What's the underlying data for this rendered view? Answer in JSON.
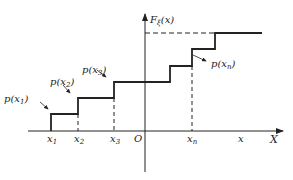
{
  "diagram": {
    "type": "step-function (cumulative distribution function)",
    "y_axis_label": "F",
    "y_axis_label_sub": "ξ",
    "y_axis_label_arg": "(x)",
    "x_axis_label": "X",
    "origin_label": "O",
    "x_ticks": [
      {
        "base": "x",
        "sub": "1"
      },
      {
        "base": "x",
        "sub": "2"
      },
      {
        "base": "x",
        "sub": "3"
      },
      {
        "base": "x",
        "sub": "n"
      },
      {
        "base": "x",
        "sub": ""
      }
    ],
    "jump_labels": [
      {
        "pre": "p(x",
        "sub": "1",
        "post": ")"
      },
      {
        "pre": "p(x",
        "sub": "2",
        "post": ")"
      },
      {
        "pre": "p(x",
        "sub": "3",
        "post": ")"
      },
      {
        "pre": "p(x",
        "sub": "n",
        "post": ")"
      }
    ],
    "colors": {
      "line": "#222222",
      "background": "#ffffff"
    }
  }
}
